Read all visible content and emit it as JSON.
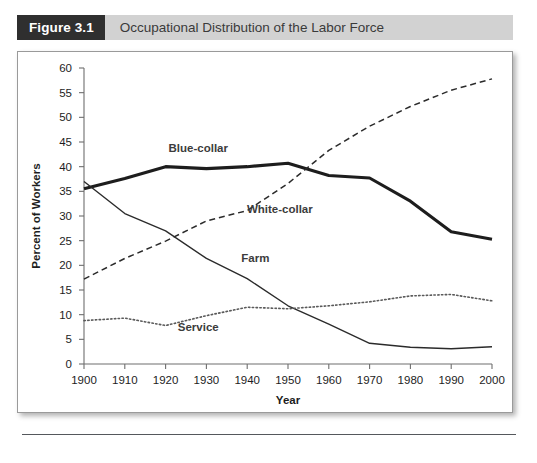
{
  "figure": {
    "number_label": "Figure 3.1",
    "caption": "Occupational Distribution of the Labor Force"
  },
  "chart_data": {
    "type": "line",
    "title": "Occupational Distribution of the Labor Force",
    "xlabel": "Year",
    "ylabel": "Percent of Workers",
    "xlim": [
      1900,
      2000
    ],
    "ylim": [
      0,
      60
    ],
    "xticks": [
      1900,
      1910,
      1920,
      1930,
      1940,
      1950,
      1960,
      1970,
      1980,
      1990,
      2000
    ],
    "yticks": [
      0,
      5,
      10,
      15,
      20,
      25,
      30,
      35,
      40,
      45,
      50,
      55,
      60
    ],
    "grid": false,
    "legend": "inline-labels",
    "x": [
      1900,
      1910,
      1920,
      1930,
      1940,
      1950,
      1960,
      1970,
      1980,
      1990,
      2000
    ],
    "series": [
      {
        "name": "Blue-collar",
        "style": "solid-thick",
        "color": "#1d1d1d",
        "width": 3.1,
        "label_x": 1928,
        "label_y": 43.0,
        "values": [
          35.5,
          37.6,
          40.0,
          39.6,
          40.0,
          40.7,
          38.2,
          37.7,
          33.0,
          26.8,
          25.3
        ]
      },
      {
        "name": "White-collar",
        "style": "dashed",
        "color": "#2b2b2b",
        "width": 1.5,
        "label_x": 1948,
        "label_y": 30.6,
        "values": [
          17.2,
          21.4,
          24.9,
          29.0,
          31.1,
          36.6,
          43.3,
          48.2,
          52.2,
          55.5,
          57.8
        ]
      },
      {
        "name": "Farm",
        "style": "solid-thin",
        "color": "#2b2b2b",
        "width": 1.4,
        "label_x": 1942,
        "label_y": 20.6,
        "values": [
          37.0,
          30.5,
          27.0,
          21.4,
          17.3,
          11.8,
          8.1,
          4.2,
          3.4,
          3.1,
          3.5
        ]
      },
      {
        "name": "Service",
        "style": "dotted",
        "color": "#5a5a5a",
        "width": 1.6,
        "label_x": 1928,
        "label_y": 6.6,
        "values": [
          8.8,
          9.3,
          7.8,
          9.8,
          11.5,
          11.2,
          11.8,
          12.6,
          13.8,
          14.1,
          12.8
        ]
      }
    ]
  }
}
